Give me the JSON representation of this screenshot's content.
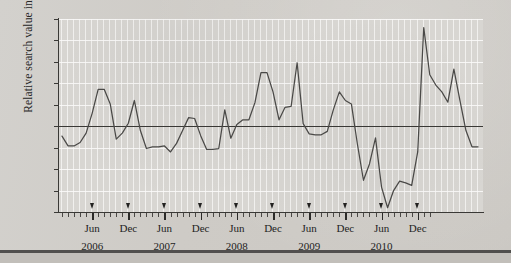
{
  "figure": {
    "ylabel": "Relative search value index"
  },
  "chart_data": {
    "type": "line",
    "title": "",
    "xlabel": "",
    "ylabel": "Relative search value index",
    "ylim": [
      -20,
      25
    ],
    "yticks": [
      25,
      20,
      15,
      10,
      5,
      0,
      -5,
      -10,
      -15,
      -20
    ],
    "ytick_labels": [
      "25",
      "20",
      "15",
      "10",
      "5",
      "0",
      "−5",
      "−10",
      "−15",
      "−20"
    ],
    "grid": "vertical-monthly-and-horizontal",
    "legend": "none",
    "zero_line": 0,
    "x_tick_labels": [
      "Jun",
      "Dec",
      "Jun",
      "Dec",
      "Jun",
      "Dec",
      "Jun",
      "Dec",
      "Jun",
      "Dec"
    ],
    "x_year_labels": [
      "2006",
      "2007",
      "2008",
      "2009",
      "2010"
    ],
    "x_marker_months": [
      "2006-06",
      "2006-12",
      "2007-06",
      "2007-12",
      "2008-06",
      "2008-12",
      "2009-06",
      "2009-12",
      "2010-06",
      "2010-12"
    ],
    "x_start": "2006-01",
    "x_end": "2011-02",
    "x": [
      "2006-01",
      "2006-02",
      "2006-03",
      "2006-04",
      "2006-05",
      "2006-06",
      "2006-07",
      "2006-08",
      "2006-09",
      "2006-10",
      "2006-11",
      "2006-12",
      "2007-01",
      "2007-02",
      "2007-03",
      "2007-04",
      "2007-05",
      "2007-06",
      "2007-07",
      "2007-08",
      "2007-09",
      "2007-10",
      "2007-11",
      "2007-12",
      "2008-01",
      "2008-02",
      "2008-03",
      "2008-04",
      "2008-05",
      "2008-06",
      "2008-07",
      "2008-08",
      "2008-09",
      "2008-10",
      "2008-11",
      "2008-12",
      "2009-01",
      "2009-02",
      "2009-03",
      "2009-04",
      "2009-05",
      "2009-06",
      "2009-07",
      "2009-08",
      "2009-09",
      "2009-10",
      "2009-11",
      "2009-12",
      "2010-01",
      "2010-02",
      "2010-03",
      "2010-04",
      "2010-05",
      "2010-06",
      "2010-07",
      "2010-08",
      "2010-09",
      "2010-10",
      "2010-11",
      "2010-12",
      "2011-01",
      "2011-02"
    ],
    "values": [
      -2.3,
      -4.6,
      -4.6,
      -3.8,
      -1.6,
      3.0,
      8.6,
      8.6,
      5.2,
      -3.0,
      -1.6,
      0.7,
      6.0,
      -1.0,
      -5.2,
      -4.8,
      -4.8,
      -4.6,
      -6.0,
      -4.0,
      -1.0,
      2.0,
      1.8,
      -2.2,
      -5.4,
      -5.4,
      -5.2,
      3.8,
      -2.8,
      0.4,
      1.5,
      1.5,
      5.5,
      12.5,
      12.5,
      8.0,
      1.5,
      4.4,
      4.6,
      14.8,
      0.6,
      -1.8,
      -2.0,
      -2.0,
      -1.2,
      3.8,
      8.0,
      6.0,
      5.2,
      -4.2,
      -12.6,
      -8.8,
      -2.7,
      -14.2,
      -19.0,
      -15.0,
      -12.8,
      -13.2,
      -13.8,
      -6.0,
      23.0,
      12.0
    ],
    "values_tail": [
      9.6,
      8.0,
      5.6,
      13.3,
      6.0,
      -1.0,
      -4.8,
      -4.8
    ],
    "series_color": "#4a4947",
    "units": "index"
  }
}
